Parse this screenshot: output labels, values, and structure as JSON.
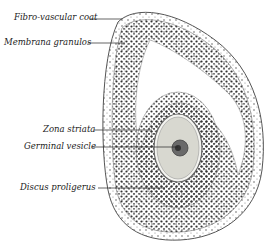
{
  "diagram": {
    "labels": [
      {
        "id": "fibro",
        "text": "Fibro-vascular coat",
        "x": 14,
        "y": 14,
        "line_to": [
          118,
          19
        ]
      },
      {
        "id": "membrana",
        "text": "Membrana granulos",
        "x": 4,
        "y": 39,
        "line_to": [
          120,
          43
        ]
      },
      {
        "id": "zona",
        "text": "Zona striata",
        "x": 43,
        "y": 126,
        "line_to": [
          150,
          130
        ]
      },
      {
        "id": "germinal",
        "text": "Germinal vesicle",
        "x": 24,
        "y": 143,
        "line_to": [
          178,
          147
        ]
      },
      {
        "id": "discus",
        "text": "Discus proligerus",
        "x": 20,
        "y": 184,
        "line_to": [
          160,
          188
        ]
      }
    ],
    "colors": {
      "ink": "#222222",
      "stroke": "#555555",
      "cell": "#333333",
      "ovum": "#d8d8d0",
      "nucleus": "#555555"
    }
  }
}
